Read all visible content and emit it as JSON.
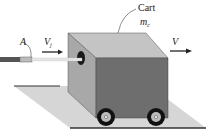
{
  "diagram": {
    "labels": {
      "cart": "Cart",
      "cart_mass": "m",
      "cart_mass_sub": "c",
      "nozzle": "A",
      "jet_velocity": "V",
      "jet_velocity_sub": "j",
      "cart_velocity": "V"
    },
    "colors": {
      "cart_front": "#a8a8a8",
      "cart_side": "#6e6e6e",
      "cart_top": "#c4c4c4",
      "ground": "#d6d6d6",
      "wheel": "#111111",
      "jet": "#e6e6e6",
      "hose": "#555555"
    }
  }
}
